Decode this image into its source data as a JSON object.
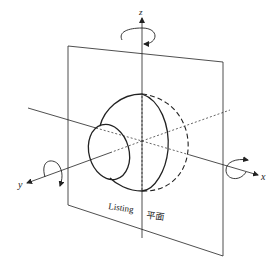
{
  "diagram": {
    "axes": {
      "z_label": "z",
      "y_label": "y",
      "x_label": "x"
    },
    "plane_label": {
      "latin": "Listing",
      "cjk": "平面"
    },
    "colors": {
      "stroke": "#222222",
      "background": "#ffffff"
    }
  }
}
